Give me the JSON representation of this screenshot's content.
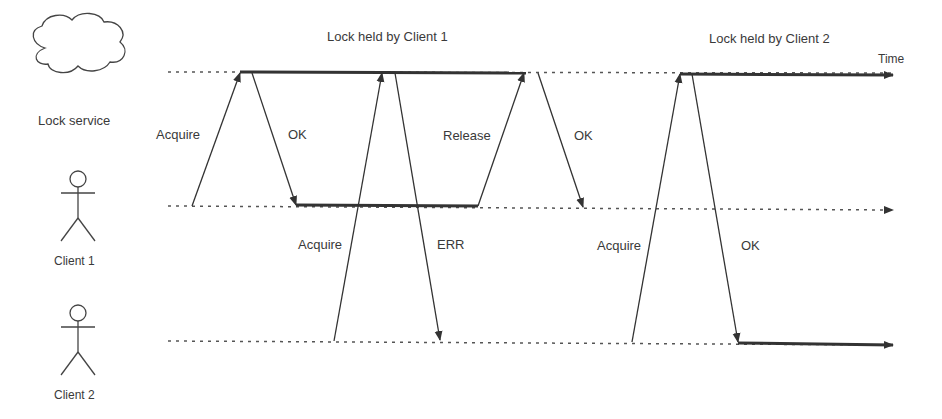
{
  "title_lock_client1": "Lock held by Client 1",
  "title_lock_client2": "Lock held by Client 2",
  "time_label": "Time",
  "actors": [
    {
      "name": "Lock service",
      "icon": "cloud-icon"
    },
    {
      "name": "Client 1",
      "icon": "stick-figure-icon"
    },
    {
      "name": "Client 2",
      "icon": "stick-figure-icon"
    }
  ],
  "messages": [
    {
      "label": "Acquire",
      "from": "Client 1",
      "to": "Lock service"
    },
    {
      "label": "OK",
      "from": "Lock service",
      "to": "Client 1"
    },
    {
      "label": "Acquire",
      "from": "Client 2",
      "to": "Lock service"
    },
    {
      "label": "ERR",
      "from": "Lock service",
      "to": "Client 2"
    },
    {
      "label": "Release",
      "from": "Client 1",
      "to": "Lock service"
    },
    {
      "label": "OK",
      "from": "Lock service",
      "to": "Client 1"
    },
    {
      "label": "Acquire",
      "from": "Client 2",
      "to": "Lock service"
    },
    {
      "label": "OK",
      "from": "Lock service",
      "to": "Client 2"
    }
  ],
  "colors": {
    "line": "#333333",
    "dotted": "#555555",
    "text": "#3a3a3a"
  }
}
